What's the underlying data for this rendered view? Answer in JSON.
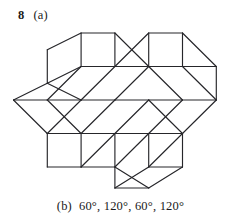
{
  "page": {
    "background_color": "#ffffff",
    "ink_color": "#26262a"
  },
  "top_label": {
    "item_number": "8",
    "part_tag": "(a)"
  },
  "bottom_label": {
    "part_tag": "(b)",
    "answer_text": "60°, 120°, 60°, 120°"
  },
  "figure": {
    "name": "rhombus-tiling",
    "stroke_color": "#26262a",
    "stroke_width": 1.15,
    "fill": "none",
    "lattice": {
      "origin_x": 13.5,
      "origin_y": 100.0,
      "step_x": 33.8,
      "step_y": 33.5,
      "columns": 7,
      "rows": 6
    },
    "segments": [
      "M 13.5,100 L 47.3,83.2",
      "M 47.3,83.2 L 47.3,49.7",
      "M 47.3,49.7 L 81.1,33.0",
      "M 81.1,33.0 L 114.9,33.0",
      "M 114.9,33.0 L 148.7,66.5",
      "M 148.7,66.5 L 148.7,33.0",
      "M 148.7,33.0 L 182.5,33.0",
      "M 182.5,33.0 L 216.3,66.5",
      "M 216.3,66.5 L 216.3,100.0",
      "M 216.3,100.0 L 182.5,133.5",
      "M 182.5,133.5 L 182.5,167.0",
      "M 182.5,167.0 L 148.7,188.0",
      "M 148.7,188.0 L 114.9,188.0",
      "M 114.9,188.0 L 114.9,167.0",
      "M 114.9,167.0 L 81.1,167.0",
      "M 81.1,167.0 L 47.3,167.0",
      "M 47.3,167.0 L 47.3,133.5",
      "M 47.3,133.5 L 13.5,100",
      "M 47.3,83.2 L 81.1,66.5",
      "M 81.1,66.5 L 114.9,66.5",
      "M 114.9,66.5 L 148.7,66.5",
      "M 148.7,66.5 L 182.5,66.5",
      "M 182.5,66.5 L 216.3,66.5",
      "M 47.3,133.5 L 81.1,133.5",
      "M 81.1,133.5 L 114.9,133.5",
      "M 114.9,133.5 L 148.7,133.5",
      "M 148.7,133.5 L 182.5,133.5",
      "M 13.5,100 L 47.3,100",
      "M 47.3,100 L 81.1,100",
      "M 81.1,100 L 114.9,100",
      "M 114.9,100 L 148.7,100",
      "M 148.7,100 L 182.5,100",
      "M 182.5,100 L 216.3,100",
      "M 81.1,33.0 L 81.1,66.5",
      "M 114.9,33.0 L 114.9,66.5",
      "M 148.7,33.0 L 114.9,66.5",
      "M 182.5,33.0 L 182.5,66.5",
      "M 47.3,83.2 L 81.1,100",
      "M 81.1,66.5 L 47.3,100",
      "M 114.9,66.5 L 81.1,100",
      "M 148.7,66.5 L 114.9,100",
      "M 148.7,66.5 L 182.5,100",
      "M 182.5,66.5 L 216.3,100",
      "M 47.3,100 L 81.1,133.5",
      "M 81.1,100 L 47.3,133.5",
      "M 114.9,100 L 81.1,133.5",
      "M 148.7,100 L 114.9,133.5",
      "M 148.7,100 L 182.5,133.5",
      "M 182.5,100 L 148.7,133.5",
      "M 81.1,133.5 L 81.1,167.0",
      "M 114.9,133.5 L 81.1,167.0",
      "M 114.9,133.5 L 114.9,167.0",
      "M 148.7,133.5 L 114.9,167.0",
      "M 148.7,133.5 L 148.7,167.0",
      "M 182.5,133.5 L 148.7,167.0",
      "M 148.7,167.0 L 114.9,188.0",
      "M 148.7,167.0 L 182.5,167.0",
      "M 114.9,167.0 L 148.7,188.0"
    ]
  }
}
